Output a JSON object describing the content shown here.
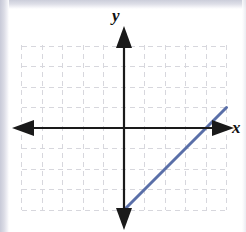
{
  "figure": {
    "kind": "coordinate-plane-line-graph",
    "background_color": "#ffffff",
    "axis_color": "#1a1a1a",
    "grid_color": "#d7d7dd",
    "line_color": "#5a6fa8",
    "axis_labels": {
      "x": "x",
      "y": "y"
    }
  },
  "chart_data": {
    "type": "line",
    "title": "",
    "xlabel": "x",
    "ylabel": "y",
    "xlim": [
      -5,
      5
    ],
    "ylim": [
      -5,
      5
    ],
    "grid": true,
    "grid_style": "dashed",
    "grid_step": 1,
    "legend": "none",
    "axes_arrows": true,
    "series": [
      {
        "name": "y = x - 4",
        "slope": 1,
        "intercept": -4,
        "color": "#5a6fa8",
        "x": [
          0,
          5
        ],
        "values": [
          -4,
          1
        ],
        "points": [
          {
            "x": 0,
            "y": -4
          },
          {
            "x": 4,
            "y": 0
          },
          {
            "x": 5,
            "y": 1
          }
        ],
        "x_intercept": 4,
        "y_intercept": -4
      }
    ],
    "xticks": [
      -5,
      -4,
      -3,
      -2,
      -1,
      0,
      1,
      2,
      3,
      4,
      5
    ],
    "yticks": [
      -5,
      -4,
      -3,
      -2,
      -1,
      0,
      1,
      2,
      3,
      4,
      5
    ],
    "xticklabels": [],
    "yticklabels": []
  }
}
